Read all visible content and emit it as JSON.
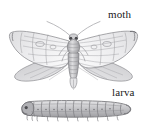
{
  "figure": {
    "kind": "scientific-illustration",
    "background_color": "#ffffff",
    "width": 147,
    "height": 131
  },
  "labels": {
    "moth": "moth",
    "larva": "larva"
  },
  "illustrations": {
    "moth": {
      "name": "moth-illustration",
      "description": "adult moth with wings spread, antennae swept back, segmented abdomen",
      "ink_color": "#8e8e90",
      "shade_color": "#b9b9bc",
      "dark_color": "#5f5f62"
    },
    "larva": {
      "name": "larva-illustration",
      "description": "segmented caterpillar larva shown in side view with prolegs",
      "segment_count": 12,
      "ink_color": "#87878a",
      "shade_color": "#b4b4b7",
      "dark_color": "#5a5a5d"
    }
  }
}
